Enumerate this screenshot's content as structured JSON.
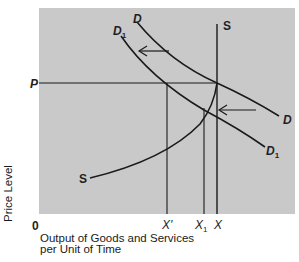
{
  "diagram": {
    "type": "aggregate supply and demand (price level vs output)",
    "axes": {
      "y_label": "Price Level",
      "x_label_line1": "Output of Goods and Services",
      "x_label_line2": "per Unit of Time",
      "origin": "0"
    },
    "price_label": "P",
    "curves": {
      "demand": {
        "label": "D"
      },
      "demand_shifted": {
        "label": "D",
        "subscript": "1"
      },
      "supply": {
        "label_top": "S",
        "label_bottom": "S"
      }
    },
    "x_ticks": {
      "x_prime": "X'",
      "x1": {
        "label": "X",
        "subscript": "1"
      },
      "x": "X"
    },
    "arrows": [
      "shift-left-upper",
      "shift-left-lower"
    ],
    "colors": {
      "plot_background": "#c9c9c9",
      "line": "#1a1a1a",
      "page_background": "#ffffff"
    }
  }
}
